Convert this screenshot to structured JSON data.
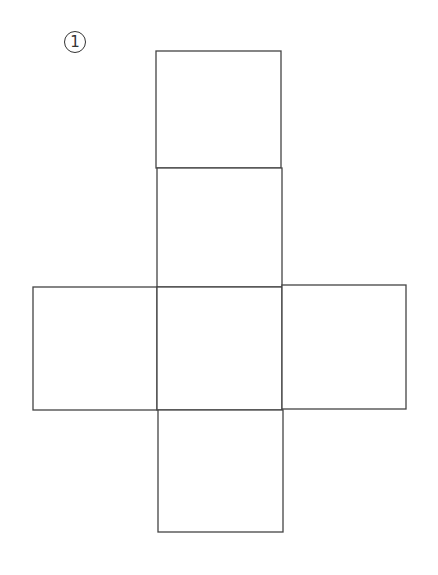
{
  "problem_label": "1",
  "stroke_color": "#444444",
  "diagram": {
    "type": "cube-net",
    "faces": [
      {
        "name": "top",
        "x": 156,
        "y": 51,
        "w": 125,
        "h": 117
      },
      {
        "name": "upper-middle",
        "x": 157,
        "y": 168,
        "w": 125,
        "h": 119
      },
      {
        "name": "left",
        "x": 33,
        "y": 287,
        "w": 124,
        "h": 123
      },
      {
        "name": "center",
        "x": 157,
        "y": 287,
        "w": 125,
        "h": 123
      },
      {
        "name": "right",
        "x": 282,
        "y": 285,
        "w": 124,
        "h": 124
      },
      {
        "name": "bottom",
        "x": 158,
        "y": 410,
        "w": 125,
        "h": 122
      }
    ]
  }
}
